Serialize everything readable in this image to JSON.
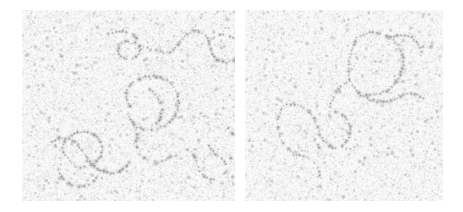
{
  "figure": {
    "background_color": "#ffffff",
    "width": 463,
    "height": 212,
    "caption": ""
  },
  "panels": [
    {
      "id": "panel-left",
      "label": "",
      "x": 22,
      "y": 10,
      "width": 213,
      "height": 191,
      "substrate_color": "#fafafa",
      "grain_color": "#b9b9b9",
      "filament_color": "#8d8d8d",
      "grain_density": 0.46,
      "bead_spacing": 3.1,
      "bead_radius": 1.35,
      "filaments": [
        {
          "name": "upper-left-arc",
          "closed": false,
          "points": [
            [
              84,
              26
            ],
            [
              92,
              22
            ],
            [
              101,
              21
            ],
            [
              110,
              24
            ],
            [
              116,
              30
            ],
            [
              119,
              37
            ],
            [
              117,
              44
            ],
            [
              112,
              48
            ],
            [
              104,
              49
            ],
            [
              98,
              45
            ],
            [
              96,
              39
            ],
            [
              99,
              33
            ],
            [
              106,
              31
            ],
            [
              113,
              33
            ]
          ]
        },
        {
          "name": "upper-right-sweep",
          "closed": false,
          "points": [
            [
              118,
              36
            ],
            [
              127,
              38
            ],
            [
              136,
              41
            ],
            [
              144,
              43
            ],
            [
              151,
              40
            ],
            [
              157,
              34
            ],
            [
              162,
              27
            ],
            [
              168,
              22
            ],
            [
              176,
              21
            ],
            [
              183,
              25
            ],
            [
              187,
              32
            ],
            [
              189,
              40
            ],
            [
              192,
              47
            ],
            [
              198,
              51
            ],
            [
              206,
              52
            ],
            [
              213,
              50
            ],
            [
              219,
              45
            ]
          ]
        },
        {
          "name": "upper-right-tail",
          "closed": false,
          "points": [
            [
              186,
              31
            ],
            [
              193,
              27
            ],
            [
              201,
              25
            ],
            [
              209,
              26
            ],
            [
              216,
              30
            ],
            [
              221,
              36
            ]
          ]
        },
        {
          "name": "central-large-loop",
          "closed": true,
          "points": [
            [
              108,
              96
            ],
            [
              104,
              87
            ],
            [
              106,
              78
            ],
            [
              113,
              71
            ],
            [
              122,
              67
            ],
            [
              132,
              66
            ],
            [
              142,
              69
            ],
            [
              150,
              75
            ],
            [
              155,
              83
            ],
            [
              157,
              92
            ],
            [
              155,
              101
            ],
            [
              150,
              109
            ],
            [
              143,
              115
            ],
            [
              134,
              119
            ],
            [
              124,
              120
            ],
            [
              115,
              117
            ],
            [
              109,
              111
            ],
            [
              106,
              104
            ]
          ]
        },
        {
          "name": "central-inner-branch",
          "closed": false,
          "points": [
            [
              128,
              80
            ],
            [
              134,
              85
            ],
            [
              138,
              92
            ],
            [
              140,
              100
            ],
            [
              138,
              108
            ],
            [
              133,
              114
            ]
          ]
        },
        {
          "name": "central-lower-tail",
          "closed": false,
          "points": [
            [
              118,
              118
            ],
            [
              115,
              126
            ],
            [
              114,
              135
            ],
            [
              117,
              143
            ],
            [
              124,
              149
            ],
            [
              133,
              152
            ],
            [
              142,
              151
            ],
            [
              149,
              146
            ]
          ]
        },
        {
          "name": "left-lower-loop",
          "closed": true,
          "points": [
            [
              45,
              148
            ],
            [
              41,
              140
            ],
            [
              43,
              131
            ],
            [
              50,
              125
            ],
            [
              60,
              122
            ],
            [
              70,
              124
            ],
            [
              77,
              130
            ],
            [
              80,
              138
            ],
            [
              78,
              147
            ],
            [
              72,
              154
            ],
            [
              63,
              157
            ],
            [
              53,
              156
            ]
          ]
        },
        {
          "name": "left-lower-strand",
          "closed": false,
          "points": [
            [
              30,
              131
            ],
            [
              38,
              128
            ],
            [
              47,
              129
            ],
            [
              55,
              134
            ],
            [
              61,
              141
            ],
            [
              66,
              149
            ],
            [
              72,
              156
            ],
            [
              80,
              161
            ],
            [
              89,
              163
            ],
            [
              98,
              161
            ],
            [
              105,
              156
            ],
            [
              109,
              149
            ]
          ]
        },
        {
          "name": "left-bottom-hook",
          "closed": false,
          "points": [
            [
              36,
              160
            ],
            [
              40,
              168
            ],
            [
              47,
              174
            ],
            [
              56,
              177
            ],
            [
              65,
              176
            ],
            [
              72,
              171
            ],
            [
              76,
              164
            ]
          ]
        },
        {
          "name": "right-lower-zigzag",
          "closed": false,
          "points": [
            [
              166,
              140
            ],
            [
              172,
              146
            ],
            [
              176,
              154
            ],
            [
              179,
              162
            ],
            [
              185,
              168
            ],
            [
              193,
              170
            ],
            [
              200,
              167
            ],
            [
              204,
              160
            ],
            [
              203,
              152
            ],
            [
              198,
              146
            ]
          ]
        },
        {
          "name": "right-lower-branch",
          "closed": false,
          "points": [
            [
              186,
              132
            ],
            [
              190,
              140
            ],
            [
              196,
              146
            ],
            [
              204,
              149
            ],
            [
              212,
              148
            ],
            [
              218,
              143
            ],
            [
              221,
              136
            ]
          ]
        },
        {
          "name": "right-edge-strand",
          "closed": false,
          "points": [
            [
              206,
              118
            ],
            [
              212,
              124
            ],
            [
              216,
              132
            ],
            [
              218,
              141
            ],
            [
              222,
              149
            ],
            [
              228,
              154
            ]
          ]
        }
      ]
    },
    {
      "id": "panel-right",
      "label": "",
      "x": 245,
      "y": 10,
      "width": 198,
      "height": 191,
      "substrate_color": "#fafafa",
      "grain_color": "#bcbcbc",
      "filament_color": "#939393",
      "grain_density": 0.44,
      "bead_spacing": 3.2,
      "bead_radius": 1.3,
      "filaments": [
        {
          "name": "upper-right-big-loop",
          "closed": true,
          "points": [
            [
              112,
              28
            ],
            [
              123,
              23
            ],
            [
              135,
              23
            ],
            [
              146,
              28
            ],
            [
              154,
              37
            ],
            [
              158,
              48
            ],
            [
              157,
              60
            ],
            [
              152,
              71
            ],
            [
              144,
              79
            ],
            [
              134,
              84
            ],
            [
              123,
              85
            ],
            [
              113,
              81
            ],
            [
              106,
              73
            ],
            [
              103,
              63
            ],
            [
              104,
              52
            ],
            [
              107,
              40
            ]
          ]
        },
        {
          "name": "upper-right-spur",
          "closed": false,
          "points": [
            [
              146,
              27
            ],
            [
              155,
              25
            ],
            [
              164,
              26
            ],
            [
              171,
              31
            ],
            [
              175,
              39
            ],
            [
              176,
              48
            ]
          ]
        },
        {
          "name": "mid-horizontal-run",
          "closed": false,
          "points": [
            [
              113,
              83
            ],
            [
              121,
              88
            ],
            [
              130,
              91
            ],
            [
              140,
              92
            ],
            [
              149,
              90
            ],
            [
              157,
              86
            ],
            [
              165,
              84
            ],
            [
              173,
              85
            ],
            [
              179,
              89
            ]
          ]
        },
        {
          "name": "mid-left-connector",
          "closed": false,
          "points": [
            [
              104,
              70
            ],
            [
              97,
              76
            ],
            [
              91,
              83
            ],
            [
              87,
              91
            ],
            [
              85,
              100
            ]
          ]
        },
        {
          "name": "lower-left-v-loop",
          "closed": false,
          "points": [
            [
              36,
              98
            ],
            [
              45,
              95
            ],
            [
              55,
              96
            ],
            [
              63,
              101
            ],
            [
              69,
              108
            ],
            [
              73,
              117
            ],
            [
              76,
              126
            ],
            [
              81,
              133
            ],
            [
              88,
              137
            ],
            [
              96,
              136
            ],
            [
              102,
              130
            ],
            [
              105,
              122
            ],
            [
              104,
              113
            ],
            [
              99,
              106
            ],
            [
              92,
              102
            ],
            [
              84,
              101
            ]
          ]
        },
        {
          "name": "lower-left-descender",
          "closed": false,
          "points": [
            [
              36,
              100
            ],
            [
              33,
              109
            ],
            [
              33,
              119
            ],
            [
              36,
              128
            ],
            [
              41,
              136
            ],
            [
              48,
              142
            ],
            [
              56,
              146
            ],
            [
              64,
              148
            ]
          ]
        },
        {
          "name": "lower-left-tail",
          "closed": false,
          "points": [
            [
              64,
              148
            ],
            [
              70,
              154
            ],
            [
              74,
              161
            ],
            [
              76,
              169
            ],
            [
              75,
              177
            ]
          ]
        },
        {
          "name": "lower-left-short-branch",
          "closed": false,
          "points": [
            [
              59,
              121
            ],
            [
              66,
              126
            ],
            [
              72,
              133
            ],
            [
              76,
              141
            ]
          ]
        }
      ]
    }
  ],
  "rendering": {
    "noise_seed": 20240517,
    "noise_label": "substrate-grain",
    "filament_label": "dna-molecule"
  }
}
